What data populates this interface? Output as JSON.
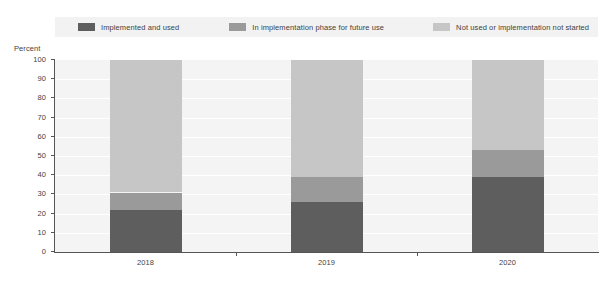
{
  "chart_data": {
    "type": "bar",
    "subtype": "stacked-100-percent",
    "title": "",
    "subtitle": "",
    "xlabel": "",
    "ylabel": "Percent",
    "ylim": [
      0,
      100
    ],
    "ytick_labels": [
      "100",
      "90",
      "80",
      "70",
      "60",
      "50",
      "40",
      "30",
      "20",
      "10",
      "0"
    ],
    "ytick_values": [
      100,
      90,
      80,
      70,
      60,
      50,
      40,
      30,
      20,
      10,
      0
    ],
    "categories": [
      "2018",
      "2019",
      "2020"
    ],
    "grid": true,
    "grid_axis": "y",
    "legend_position": "top",
    "series": [
      {
        "name": "Implemented and used",
        "color": "#5e5e5e",
        "values": [
          22,
          26,
          39
        ]
      },
      {
        "name": "In implementation phase for future use",
        "color": "#9a9a9a",
        "values": [
          9,
          13,
          14
        ]
      },
      {
        "name": "Not used or implementation not started",
        "color": "#c6c6c6",
        "values": [
          69,
          61,
          47
        ]
      }
    ],
    "colors": {
      "series_1": "#5e5e5e",
      "series_2": "#9a9a9a",
      "series_3": "#c6c6c6",
      "plot_background": "#f4f4f4",
      "legend_background": "#f2f2f2",
      "axis": "#555555",
      "text": "#3f3f3f",
      "page_background": "#ffffff"
    }
  }
}
